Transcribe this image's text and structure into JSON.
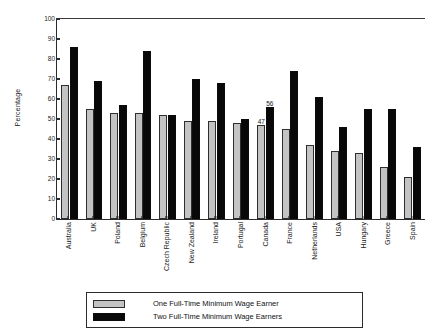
{
  "chart_data": {
    "type": "bar",
    "title": "",
    "xlabel": "",
    "ylabel": "Percentage",
    "ylim": [
      0,
      100
    ],
    "y_ticks": [
      0,
      10,
      20,
      30,
      40,
      50,
      60,
      70,
      80,
      90,
      100
    ],
    "grid": false,
    "legend_position": "bottom",
    "categories": [
      "Australia",
      "UK",
      "Poland",
      "Belgium",
      "Czech Republic",
      "New Zealand",
      "Ireland",
      "Portugal",
      "Canada",
      "France",
      "Netherlands",
      "USA",
      "Hungary",
      "Greece",
      "Spain"
    ],
    "series": [
      {
        "name": "One Full-Time Minimum Wage Earner",
        "color": "#c3c3c3",
        "values": [
          67,
          55,
          53,
          53,
          52,
          49,
          49,
          48,
          47,
          45,
          37,
          34,
          33,
          26,
          21
        ]
      },
      {
        "name": "Two Full-Time Minimum Wage Earners",
        "color": "#080808",
        "values": [
          86,
          69,
          57,
          84,
          52,
          70,
          68,
          50,
          56,
          74,
          61,
          46,
          55,
          55,
          36
        ]
      }
    ],
    "data_labels": [
      {
        "category": "Canada",
        "series": "One Full-Time Minimum Wage Earner",
        "value": "47"
      },
      {
        "category": "Canada",
        "series": "Two Full-Time Minimum Wage Earners",
        "value": "56"
      }
    ]
  },
  "legend": {
    "items": [
      {
        "label": "One Full-Time Minimum Wage Earner",
        "swatch": "light"
      },
      {
        "label": "Two Full-Time Minimum Wage Earners",
        "swatch": "dark"
      }
    ]
  }
}
